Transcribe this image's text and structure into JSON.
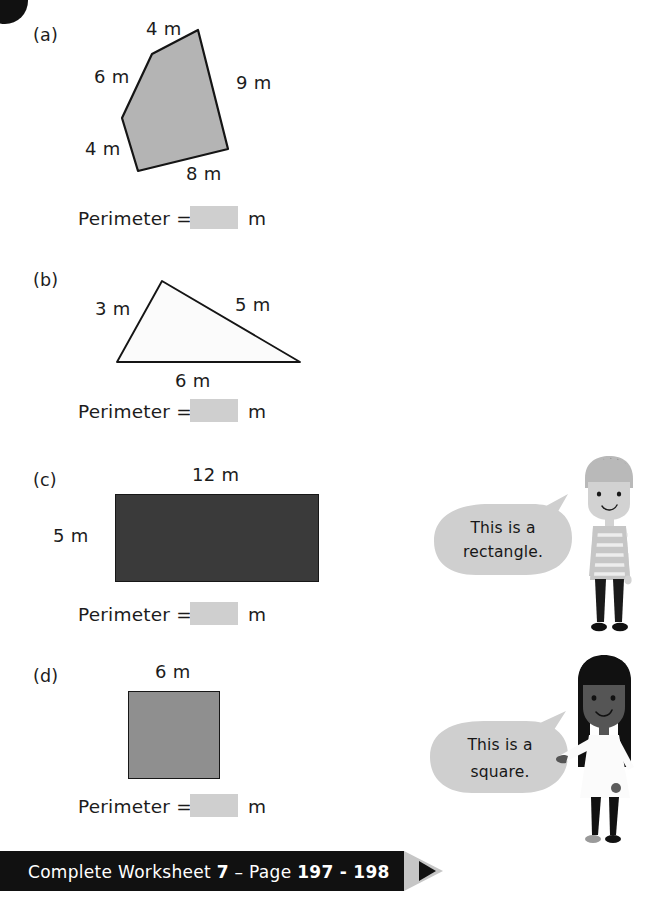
{
  "page": {
    "width": 651,
    "height": 901,
    "background": "#ffffff"
  },
  "colors": {
    "ink": "#1c1c1c",
    "answer_box": "#cfcfcf",
    "pentagon_fill": "#b4b4b4",
    "triangle_fill": "#fbfbfb",
    "rectangle_fill": "#3a3a3a",
    "square_fill": "#8f8f8f",
    "bubble_fill": "#cfcfcf",
    "banner_fill": "#111111",
    "banner_text": "#ffffff",
    "banner_arrow": "#c6c6c6"
  },
  "question": {
    "badge_visible": true
  },
  "items": [
    {
      "label": "(a)",
      "shape": "pentagon",
      "dimensions": [
        {
          "text": "4 m",
          "position": "top"
        },
        {
          "text": "6 m",
          "position": "upper-left"
        },
        {
          "text": "9 m",
          "position": "right"
        },
        {
          "text": "4 m",
          "position": "lower-left"
        },
        {
          "text": "8 m",
          "position": "bottom"
        }
      ],
      "answer_prompt": "Perimeter =",
      "answer_value": "",
      "answer_unit": "m"
    },
    {
      "label": "(b)",
      "shape": "triangle",
      "dimensions": [
        {
          "text": "3 m",
          "position": "left"
        },
        {
          "text": "5 m",
          "position": "right"
        },
        {
          "text": "6 m",
          "position": "bottom"
        }
      ],
      "answer_prompt": "Perimeter =",
      "answer_value": "",
      "answer_unit": "m"
    },
    {
      "label": "(c)",
      "shape": "rectangle",
      "dimensions": [
        {
          "text": "12 m",
          "position": "top"
        },
        {
          "text": "5 m",
          "position": "left"
        }
      ],
      "answer_prompt": "Perimeter =",
      "answer_value": "",
      "answer_unit": "m"
    },
    {
      "label": "(d)",
      "shape": "square",
      "dimensions": [
        {
          "text": "6 m",
          "position": "top"
        }
      ],
      "answer_prompt": "Perimeter =",
      "answer_value": "",
      "answer_unit": "m"
    }
  ],
  "characters": [
    {
      "id": "boy",
      "bubble_line1": "This is a",
      "bubble_line2": "rectangle."
    },
    {
      "id": "girl",
      "bubble_line1": "This is a",
      "bubble_line2": "square."
    }
  ],
  "footer": {
    "prefix": "Complete Worksheet ",
    "worksheet_number": "7",
    "separator": " – Page ",
    "pages": "197 - 198"
  }
}
